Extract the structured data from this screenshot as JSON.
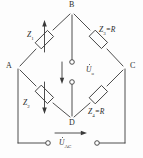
{
  "diagram": {
    "type": "wheatstone-bridge",
    "stroke_color": "#3a3a3a",
    "text_color": "#2b2b2b",
    "background": "#fdfdfd",
    "nodes": [
      {
        "id": "B",
        "label": "B",
        "x": 72,
        "y": 12
      },
      {
        "id": "A",
        "label": "A",
        "x": 18,
        "y": 68
      },
      {
        "id": "C",
        "label": "C",
        "x": 125,
        "y": 68
      },
      {
        "id": "D",
        "label": "D",
        "x": 72,
        "y": 118
      }
    ],
    "components": [
      {
        "id": "Z1",
        "label": "Z",
        "sub": "1",
        "suffix": "",
        "arm": "A-B",
        "variable": true,
        "arrow": "up"
      },
      {
        "id": "Z3",
        "label": "Z",
        "sub": "3",
        "suffix": "=R",
        "arm": "B-C",
        "variable": false,
        "arrow": "none"
      },
      {
        "id": "Z2",
        "label": "Z",
        "sub": "2",
        "suffix": "",
        "arm": "A-D",
        "variable": true,
        "arrow": "down"
      },
      {
        "id": "Z4",
        "label": "Z",
        "sub": "4",
        "suffix": "=R",
        "arm": "D-C",
        "variable": false,
        "arrow": "none"
      }
    ],
    "voltages": [
      {
        "id": "Uo",
        "label": "U",
        "sub": "o",
        "dot": true,
        "arrow": "down",
        "branch": "B-D",
        "x": 88,
        "y": 68
      },
      {
        "id": "UAC",
        "label": "U",
        "sub": "AC",
        "dot": true,
        "arrow": "right",
        "branch": "bottom",
        "x": 60,
        "y": 142
      }
    ],
    "terminals": [
      {
        "id": "t-bd-upper",
        "x": 72,
        "y": 62
      },
      {
        "id": "t-bd-lower",
        "x": 72,
        "y": 82
      },
      {
        "id": "t-bottom-left",
        "x": 48,
        "y": 143
      },
      {
        "id": "t-bottom-right",
        "x": 97,
        "y": 143
      }
    ]
  }
}
